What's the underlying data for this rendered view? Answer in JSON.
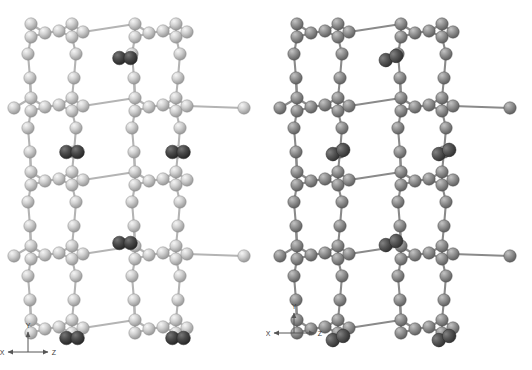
{
  "figure": {
    "background_color": "#ffffff",
    "width": 532,
    "height": 370
  },
  "panels": [
    {
      "id": "panel-left",
      "name": "left-view",
      "label": "",
      "origin_x": 0,
      "width": 266,
      "height": 370,
      "framework_atom_color": "#c9c9c9",
      "framework_atom_highlight": "#f2f2f2",
      "framework_atom_shadow": "#8e8e8e",
      "bond_color": "#b4b4b4",
      "guest_atom_color": "#4a4a4a",
      "guest_atom_highlight": "#6e6e6e",
      "guest_atom_shadow": "#262626",
      "atom_radius": 6.2,
      "guest_radius": 6.8,
      "axis": {
        "name": "axis-indicator",
        "origin_x": 28,
        "origin_y": 352,
        "x_label": "X",
        "y_label": "Y",
        "z_label": "Z",
        "arrow_color": "#555555",
        "label_color": "#3a3a3a"
      }
    },
    {
      "id": "panel-right",
      "name": "right-view",
      "label": "",
      "origin_x": 266,
      "width": 266,
      "height": 370,
      "framework_atom_color": "#8e8e8e",
      "framework_atom_highlight": "#bdbdbd",
      "framework_atom_shadow": "#555555",
      "bond_color": "#8a8a8a",
      "guest_atom_color": "#555555",
      "guest_atom_highlight": "#787878",
      "guest_atom_shadow": "#2e2e2e",
      "atom_radius": 6.2,
      "guest_radius": 6.8,
      "axis": {
        "name": "axis-indicator",
        "origin_x": 28,
        "origin_y": 333,
        "x_label": "X",
        "y_label": "Y",
        "z_label": "Z",
        "arrow_color": "#555555",
        "label_color": "#3a3a3a"
      }
    }
  ],
  "structure": {
    "description": "Tetrahedral framework viewed along x, channels running vertically (y) with diatomic molecules adsorbed in the pores",
    "unit_cell_repeat_y": 74,
    "unit_cell_repeat_z": 104,
    "columns_z": [
      50,
      154
    ],
    "rows_y": [
      30,
      104,
      178,
      252,
      326
    ],
    "guest_molecules_left": [
      {
        "cx": 125,
        "cy": 58,
        "tilt": 0
      },
      {
        "cx": 72,
        "cy": 152,
        "tilt": 0
      },
      {
        "cx": 178,
        "cy": 152,
        "tilt": 0
      },
      {
        "cx": 125,
        "cy": 243,
        "tilt": 0
      },
      {
        "cx": 72,
        "cy": 338,
        "tilt": 0
      },
      {
        "cx": 178,
        "cy": 338,
        "tilt": 0
      }
    ],
    "guest_molecules_right": [
      {
        "cx": 125,
        "cy": 58,
        "tilt": -22
      },
      {
        "cx": 72,
        "cy": 152,
        "tilt": -22
      },
      {
        "cx": 178,
        "cy": 152,
        "tilt": -22
      },
      {
        "cx": 125,
        "cy": 243,
        "tilt": -22
      },
      {
        "cx": 72,
        "cy": 338,
        "tilt": -22
      },
      {
        "cx": 178,
        "cy": 338,
        "tilt": -22
      }
    ]
  }
}
